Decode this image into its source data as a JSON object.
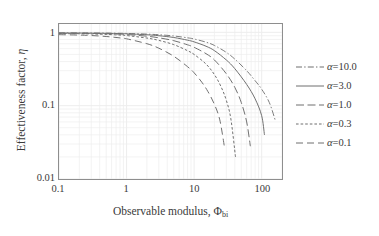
{
  "chart_data": {
    "type": "line",
    "title": "",
    "xlabel": "Observable modulus, Φ",
    "xlabel_sub": "bi",
    "ylabel": "Effectiveness factor, η",
    "xscale": "log",
    "yscale": "log",
    "xlim": [
      0.1,
      200
    ],
    "ylim": [
      0.01,
      1.3
    ],
    "xticks": [
      "0.1",
      "1",
      "10",
      "100"
    ],
    "xtick_values": [
      0.1,
      1,
      10,
      100
    ],
    "yticks": [
      "1",
      "0.1",
      "0.01"
    ],
    "ytick_values": [
      1,
      0.1,
      0.01
    ],
    "grid": "minor-log-both",
    "legend_position": "right-outside",
    "series": [
      {
        "name": "α=10.0",
        "alpha": 10.0,
        "style": "dashdot",
        "color": "#7a7a7a",
        "x": [
          0.1,
          0.2,
          0.3,
          0.5,
          0.8,
          1,
          2,
          3,
          5,
          8,
          10,
          15,
          20,
          30,
          40,
          60,
          80,
          100,
          130,
          160
        ],
        "y": [
          0.985,
          0.983,
          0.981,
          0.977,
          0.971,
          0.967,
          0.947,
          0.928,
          0.893,
          0.842,
          0.812,
          0.735,
          0.663,
          0.533,
          0.432,
          0.3,
          0.219,
          0.168,
          0.11,
          0.062
        ]
      },
      {
        "name": "α=3.0",
        "alpha": 3.0,
        "style": "solid",
        "color": "#6e6e6e",
        "x": [
          0.1,
          0.2,
          0.3,
          0.5,
          0.8,
          1,
          2,
          3,
          5,
          8,
          10,
          15,
          20,
          30,
          40,
          60,
          80,
          100,
          110
        ],
        "y": [
          0.98,
          0.978,
          0.975,
          0.97,
          0.962,
          0.956,
          0.927,
          0.9,
          0.851,
          0.782,
          0.742,
          0.647,
          0.563,
          0.42,
          0.32,
          0.195,
          0.124,
          0.073,
          0.04
        ]
      },
      {
        "name": "α=1.0",
        "alpha": 1.0,
        "style": "longdash",
        "color": "#6e6e6e",
        "x": [
          0.1,
          0.2,
          0.3,
          0.5,
          0.8,
          1,
          2,
          3,
          5,
          8,
          10,
          15,
          20,
          30,
          40,
          50,
          60,
          68
        ],
        "y": [
          0.972,
          0.969,
          0.965,
          0.957,
          0.944,
          0.935,
          0.886,
          0.843,
          0.77,
          0.676,
          0.625,
          0.512,
          0.42,
          0.272,
          0.178,
          0.11,
          0.06,
          0.028
        ]
      },
      {
        "name": "α=0.3",
        "alpha": 0.3,
        "style": "dotted",
        "color": "#6e6e6e",
        "x": [
          0.1,
          0.2,
          0.3,
          0.5,
          0.8,
          1,
          2,
          3,
          5,
          8,
          10,
          15,
          20,
          25,
          30,
          35,
          41
        ],
        "y": [
          0.962,
          0.957,
          0.951,
          0.938,
          0.918,
          0.905,
          0.836,
          0.777,
          0.68,
          0.562,
          0.5,
          0.37,
          0.265,
          0.182,
          0.118,
          0.066,
          0.02
        ]
      },
      {
        "name": "α=0.1",
        "alpha": 0.1,
        "style": "dash",
        "color": "#6e6e6e",
        "x": [
          0.1,
          0.2,
          0.3,
          0.5,
          0.8,
          1,
          2,
          3,
          5,
          8,
          10,
          13,
          16,
          20,
          24,
          28
        ],
        "y": [
          0.93,
          0.918,
          0.905,
          0.878,
          0.84,
          0.817,
          0.7,
          0.608,
          0.472,
          0.34,
          0.281,
          0.209,
          0.156,
          0.104,
          0.064,
          0.028
        ]
      }
    ]
  },
  "legend": {
    "items": [
      {
        "label": "α=10.0",
        "symbol": "α",
        "value": "=10.0",
        "style": "dashdot"
      },
      {
        "label": "α=3.0",
        "symbol": "α",
        "value": "=3.0",
        "style": "solid"
      },
      {
        "label": "α=1.0",
        "symbol": "α",
        "value": "=1.0",
        "style": "longdash"
      },
      {
        "label": "α=0.3",
        "symbol": "α",
        "value": "=0.3",
        "style": "dotted"
      },
      {
        "label": "α=0.1",
        "symbol": "α",
        "value": "=0.1",
        "style": "dash"
      }
    ]
  },
  "axes": {
    "y_tick_1": "1",
    "y_tick_01": "0.1",
    "y_tick_001": "0.01",
    "x_tick_01": "0.1",
    "x_tick_1": "1",
    "x_tick_10": "10",
    "x_tick_100": "100",
    "x_title_main": "Observable modulus, Φ",
    "x_title_sub": "bi",
    "y_title_main": "Effectiveness factor, ",
    "y_title_sym": "η"
  },
  "colors": {
    "frame": "#8e8e8e",
    "grid_minor": "#ededed",
    "curve": "#6e6e6e",
    "text": "#3a3a3a",
    "background": "#ffffff"
  }
}
